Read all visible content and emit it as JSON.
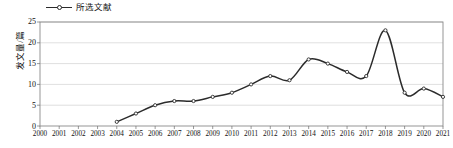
{
  "chart_data": {
    "type": "line",
    "title": "",
    "xlabel": "",
    "ylabel": "发文量/篇",
    "legend": [
      "所选文献"
    ],
    "legend_position": "top-left",
    "grid": true,
    "xlim": [
      2000,
      2021
    ],
    "ylim": [
      0,
      25
    ],
    "yticks": [
      0,
      5,
      10,
      15,
      20,
      25
    ],
    "categories": [
      2000,
      2001,
      2002,
      2003,
      2004,
      2005,
      2006,
      2007,
      2008,
      2009,
      2010,
      2011,
      2012,
      2013,
      2014,
      2015,
      2016,
      2017,
      2018,
      2019,
      2020,
      2021
    ],
    "series": [
      {
        "name": "所选文献",
        "color": "#2b2b2b",
        "values": [
          null,
          null,
          null,
          null,
          1,
          3,
          5,
          6,
          6,
          7,
          8,
          10,
          12,
          11,
          16,
          15,
          13,
          12,
          23,
          8,
          9,
          7
        ]
      }
    ],
    "x_tick_labels": [
      "2000",
      "2001",
      "2002",
      "2003",
      "2004",
      "2005",
      "2006",
      "2007",
      "2008",
      "2009",
      "2010",
      "2011",
      "2012",
      "2013",
      "2014",
      "2015",
      "2016",
      "2017",
      "2018",
      "2019",
      "2020",
      "2021"
    ],
    "y_tick_labels": [
      "0",
      "5",
      "10",
      "15",
      "20",
      "25"
    ]
  },
  "legend": {
    "marker_name": "line-marker-icon",
    "label": "所选文献"
  },
  "axis": {
    "y_title": "发文量/篇"
  }
}
